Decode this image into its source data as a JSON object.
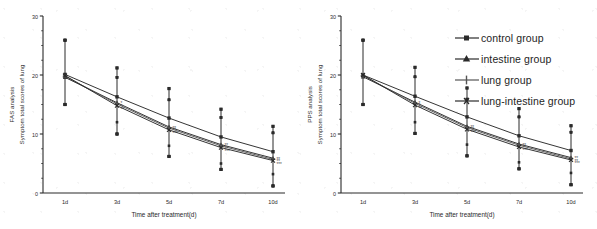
{
  "figure": {
    "background_color": "#ffffff",
    "line_color": "#2a2a2a",
    "panels": [
      {
        "id": "panel-fas",
        "analysis_label": "FAS analysis",
        "ylabel": "Symptom total scores of lung",
        "xlabel": "Time after treatment(d)"
      },
      {
        "id": "panel-pps",
        "analysis_label": "PPS analysis",
        "ylabel": "Symptom total scores of lung",
        "xlabel": "Time after treatment(d)"
      }
    ]
  },
  "legend": {
    "position": "top-right-of-second-panel",
    "items": [
      {
        "label": "control group",
        "marker": "square-marker",
        "color": "#2a2a2a"
      },
      {
        "label": "intestine group",
        "marker": "triangle-marker",
        "color": "#2a2a2a"
      },
      {
        "label": "lung group",
        "marker": "plus-marker",
        "color": "#555555"
      },
      {
        "label": "lung-intestine group",
        "marker": "cross-marker",
        "color": "#2a2a2a"
      }
    ]
  },
  "axis": {
    "y_ticks": [
      "0",
      "10",
      "20",
      "30"
    ],
    "y_tick_values": [
      0,
      10,
      20,
      30
    ],
    "x_ticks": [
      "1d",
      "3d",
      "5d",
      "7d",
      "10d"
    ],
    "ylim": [
      0,
      30
    ],
    "grid": false
  },
  "significance": {
    "single": "*",
    "double": "**",
    "triple": "***"
  },
  "chart_data": [
    {
      "type": "line",
      "title": "FAS analysis",
      "subtitle": "",
      "xlabel": "Time after treatment(d)",
      "ylabel": "Symptom total scores of lung",
      "axis_label_prefix": "FAS analysis",
      "categories": [
        "1d",
        "3d",
        "5d",
        "7d",
        "10d"
      ],
      "ylim": [
        0,
        30
      ],
      "yticks": [
        0,
        10,
        20,
        30
      ],
      "grid": false,
      "legend_position": "none",
      "series": [
        {
          "name": "control group",
          "marker": "square-marker",
          "values": [
            20.1,
            16.3,
            12.7,
            9.5,
            7.0
          ],
          "err_low": [
            15.0,
            12.0,
            8.0,
            5.0,
            3.2
          ],
          "err_high": [
            25.9,
            21.2,
            17.7,
            14.2,
            11.3
          ],
          "annotations": [
            "",
            "",
            "",
            "",
            ""
          ]
        },
        {
          "name": "intestine group",
          "marker": "triangle-marker",
          "values": [
            19.6,
            15.3,
            11.2,
            8.2,
            5.9
          ],
          "err_low": [
            15.0,
            10.0,
            6.2,
            4.0,
            1.2
          ],
          "err_high": [
            25.9,
            19.6,
            15.8,
            12.8,
            10.2
          ],
          "annotations": [
            "",
            "*",
            "**",
            "**",
            "**"
          ]
        },
        {
          "name": "lung group",
          "marker": "plus-marker",
          "values": [
            19.8,
            15.1,
            11.0,
            8.0,
            5.7
          ],
          "err_low": [
            15.0,
            10.0,
            6.2,
            4.0,
            1.2
          ],
          "err_high": [
            25.9,
            19.6,
            15.8,
            12.8,
            10.2
          ],
          "annotations": [
            "",
            "*",
            "**",
            "**",
            "**"
          ]
        },
        {
          "name": "lung-intestine group",
          "marker": "cross-marker",
          "values": [
            19.9,
            14.8,
            10.7,
            7.7,
            5.5
          ],
          "err_low": [
            15.0,
            10.0,
            6.2,
            4.0,
            1.2
          ],
          "err_high": [
            25.9,
            19.6,
            15.8,
            12.8,
            10.2
          ],
          "annotations": [
            "",
            "**",
            "***",
            "***",
            "***"
          ]
        }
      ]
    },
    {
      "type": "line",
      "title": "PPS analysis",
      "subtitle": "",
      "xlabel": "Time after treatment(d)",
      "ylabel": "Symptom total scores of lung",
      "axis_label_prefix": "PPS analysis",
      "categories": [
        "1d",
        "3d",
        "5d",
        "7d",
        "10d"
      ],
      "ylim": [
        0,
        30
      ],
      "yticks": [
        0,
        10,
        20,
        30
      ],
      "grid": false,
      "legend_position": "top-right",
      "series": [
        {
          "name": "control group",
          "marker": "square-marker",
          "values": [
            20.0,
            16.4,
            12.9,
            9.7,
            7.2
          ],
          "err_low": [
            15.0,
            12.0,
            8.2,
            5.2,
            3.4
          ],
          "err_high": [
            25.9,
            21.3,
            17.8,
            14.3,
            11.4
          ],
          "annotations": [
            "",
            "",
            "",
            "",
            ""
          ]
        },
        {
          "name": "intestine group",
          "marker": "triangle-marker",
          "values": [
            19.7,
            15.4,
            11.3,
            8.3,
            6.0
          ],
          "err_low": [
            15.0,
            10.1,
            6.3,
            4.1,
            1.4
          ],
          "err_high": [
            25.9,
            19.7,
            15.9,
            12.9,
            10.3
          ],
          "annotations": [
            "",
            "*",
            "**",
            "**",
            "**"
          ]
        },
        {
          "name": "lung group",
          "marker": "plus-marker",
          "values": [
            19.9,
            15.2,
            11.1,
            8.1,
            5.8
          ],
          "err_low": [
            15.0,
            10.1,
            6.3,
            4.1,
            1.4
          ],
          "err_high": [
            25.9,
            19.7,
            15.9,
            12.9,
            10.3
          ],
          "annotations": [
            "",
            "*",
            "**",
            "**",
            "**"
          ]
        },
        {
          "name": "lung-intestine group",
          "marker": "cross-marker",
          "values": [
            20.0,
            14.9,
            10.8,
            7.8,
            5.6
          ],
          "err_low": [
            15.0,
            10.1,
            6.3,
            4.1,
            1.4
          ],
          "err_high": [
            25.9,
            19.7,
            15.9,
            12.9,
            10.3
          ],
          "annotations": [
            "",
            "**",
            "***",
            "***",
            "***"
          ]
        }
      ]
    }
  ]
}
